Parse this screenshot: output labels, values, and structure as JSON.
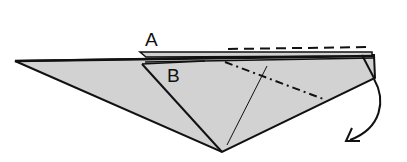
{
  "diagram": {
    "type": "origami-fold-step",
    "labels": {
      "a": "A",
      "b": "B"
    },
    "colors": {
      "paper_fill": "#d2d2d2",
      "line": "#111111",
      "background": "#ffffff"
    },
    "annotations": {
      "valley_fold_line": "dashed",
      "mountain_fold_line": "dash-dot",
      "fold_arrow": "curved-arrow-down"
    }
  }
}
